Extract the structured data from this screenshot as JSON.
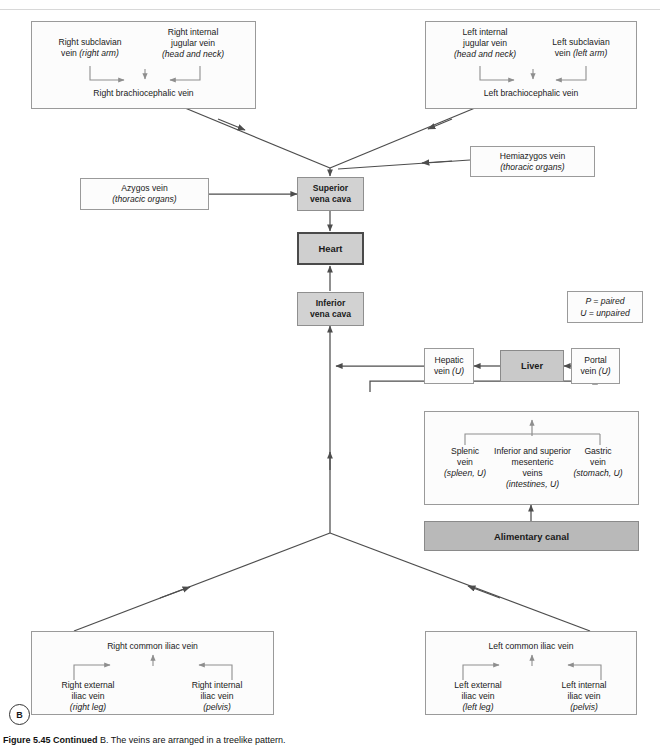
{
  "figure": {
    "panel_marker": "B",
    "caption_label": "Figure 5.45 Continued",
    "caption_rest": " B. The veins are arranged in a treelike pattern."
  },
  "legend": {
    "line1": "P = paired",
    "line2": "U = unpaired"
  },
  "boxes": {
    "right_brachiocephalic": {
      "left_label_line1": "Right subclavian",
      "left_label_line2": "vein",
      "left_label_italic": "(right arm)",
      "right_label_line1": "Right internal",
      "right_label_line2": "jugular vein",
      "right_label_italic": "(head and neck)",
      "title": "Right brachiocephalic vein"
    },
    "left_brachiocephalic": {
      "left_label_line1": "Left internal",
      "left_label_line2": "jugular vein",
      "left_label_italic": "(head and neck)",
      "right_label_line1": "Left subclavian",
      "right_label_line2": "vein",
      "right_label_italic": "(left arm)",
      "title": "Left brachiocephalic vein"
    },
    "azygos": {
      "line1": "Azygos vein",
      "line2": "(thoracic organs)"
    },
    "hemiazygos": {
      "line1": "Hemiazygos vein",
      "line2": "(thoracic organs)"
    },
    "superior_vena_cava": {
      "line1": "Superior",
      "line2": "vena cava"
    },
    "heart": {
      "line1": "Heart"
    },
    "inferior_vena_cava": {
      "line1": "Inferior",
      "line2": "vena cava"
    },
    "hepatic_vein": {
      "line1": "Hepatic",
      "line2": "vein",
      "line2_italic": "(U)"
    },
    "liver": {
      "line1": "Liver"
    },
    "portal_vein": {
      "line1": "Portal",
      "line2": "vein",
      "line2_italic": "(U)"
    },
    "gi_veins": {
      "splenic_line1": "Splenic",
      "splenic_line2": "vein",
      "splenic_italic": "(spleen, U)",
      "mesenteric_line1": "Inferior and superior",
      "mesenteric_line2": "mesenteric",
      "mesenteric_line3": "veins",
      "mesenteric_italic": "(intestines, U)",
      "gastric_line1": "Gastric",
      "gastric_line2": "vein",
      "gastric_italic": "(stomach, U)"
    },
    "alimentary_canal": {
      "line1": "Alimentary canal"
    },
    "right_common_iliac": {
      "title": "Right common iliac vein",
      "left_label_line1": "Right external",
      "left_label_line2": "iliac vein",
      "left_label_italic": "(right leg)",
      "right_label_line1": "Right internal",
      "right_label_line2": "iliac vein",
      "right_label_italic": "(pelvis)"
    },
    "left_common_iliac": {
      "title": "Left common iliac vein",
      "left_label_line1": "Left external",
      "left_label_line2": "iliac vein",
      "left_label_italic": "(left leg)",
      "right_label_line1": "Left internal",
      "right_label_line2": "iliac vein",
      "right_label_italic": "(pelvis)"
    }
  },
  "colors": {
    "box_fill": "#fcfcfc",
    "box_border": "#9a9a9a",
    "shaded_fill": "#d2d2d2",
    "heart_fill": "#cfcfcf",
    "heart_border": "#4a4a4a",
    "liver_fill": "#c9c9c9",
    "alimentary_fill": "#b9b9b9",
    "connector": "#4d4d4d",
    "inner_arrow": "#8e8e8e"
  }
}
